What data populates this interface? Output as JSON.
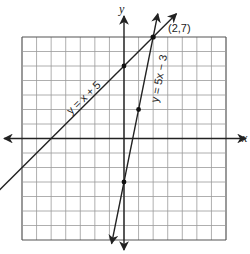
{
  "graph": {
    "x_range": [
      -7,
      7
    ],
    "y_range": [
      -7,
      7
    ],
    "grid_step": 1,
    "axis_labels": {
      "x": "x",
      "y": "y"
    },
    "colors": {
      "grid": "#9a9a9a",
      "axis": "#222222",
      "line": "#222222",
      "background": "#ffffff"
    }
  },
  "lines": [
    {
      "equation": "y = x + 5",
      "slope": 1,
      "intercept": 5,
      "label": "y = x + 5",
      "points": [
        [
          0,
          5
        ]
      ]
    },
    {
      "equation": "y = 5x − 3",
      "slope": 5,
      "intercept": -3,
      "label": "y = 5x − 3",
      "points": [
        [
          0,
          -3
        ],
        [
          1,
          2
        ]
      ]
    }
  ],
  "intersection": {
    "label": "(2,7)",
    "x": 2,
    "y": 7
  }
}
